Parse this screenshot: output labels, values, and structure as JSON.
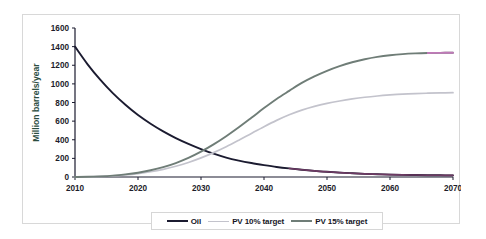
{
  "figure": {
    "background": "#ffffff",
    "frame_border_color": "#d8d8d8"
  },
  "axis": {
    "y_title": "Million barrels/year",
    "y_title_color": "#2b4d3f",
    "x_ticks": [
      "2010",
      "2020",
      "2030",
      "2040",
      "2050",
      "2060",
      "2070"
    ],
    "y_ticks": [
      "0",
      "200",
      "400",
      "600",
      "800",
      "1000",
      "1200",
      "1400",
      "1600"
    ],
    "axis_color": "#1a1a2e"
  },
  "legend": {
    "items": [
      {
        "label": "Oil",
        "color": "#1b1b30"
      },
      {
        "label": "PV 10% target",
        "color": "#c3c3cc"
      },
      {
        "label": "PV 15% target",
        "color": "#6f7d77"
      }
    ]
  },
  "chart_data": {
    "type": "line",
    "title": "",
    "xlabel": "",
    "ylabel": "Million barrels/year",
    "xlim": [
      2010,
      2070
    ],
    "ylim": [
      0,
      1600
    ],
    "xticks": [
      2010,
      2020,
      2030,
      2040,
      2050,
      2060,
      2070
    ],
    "yticks": [
      0,
      200,
      400,
      600,
      800,
      1000,
      1200,
      1400,
      1600
    ],
    "grid": false,
    "legend_position": "bottom",
    "x": [
      2010,
      2012,
      2014,
      2016,
      2018,
      2020,
      2022,
      2024,
      2026,
      2028,
      2030,
      2032,
      2034,
      2036,
      2038,
      2040,
      2042,
      2044,
      2046,
      2048,
      2050,
      2052,
      2054,
      2056,
      2058,
      2060,
      2062,
      2064,
      2066,
      2068,
      2070
    ],
    "series": [
      {
        "name": "Oil",
        "color": "#1b1b30",
        "values": [
          1400,
          1210,
          1045,
          900,
          775,
          665,
          572,
          490,
          418,
          356,
          300,
          250,
          208,
          176,
          150,
          128,
          108,
          92,
          78,
          66,
          56,
          47,
          40,
          34,
          30,
          26,
          23,
          21,
          19,
          18,
          17
        ]
      },
      {
        "name": "PV 10% target",
        "color": "#c3c3cc",
        "values": [
          0,
          2,
          6,
          12,
          22,
          36,
          56,
          82,
          115,
          156,
          205,
          262,
          325,
          395,
          468,
          540,
          608,
          668,
          718,
          758,
          790,
          816,
          838,
          856,
          870,
          881,
          890,
          896,
          900,
          903,
          905
        ]
      },
      {
        "name": "PV 15% target",
        "color": "#6f7d77",
        "values": [
          0,
          2,
          7,
          15,
          28,
          46,
          72,
          106,
          150,
          205,
          272,
          350,
          438,
          534,
          636,
          740,
          838,
          925,
          1010,
          1080,
          1140,
          1190,
          1232,
          1265,
          1290,
          1308,
          1320,
          1327,
          1331,
          1333,
          1334
        ]
      }
    ],
    "annotations": [
      {
        "text": "Oil and PV curves cross near 2032 at about 170 million barrels/year"
      }
    ]
  }
}
